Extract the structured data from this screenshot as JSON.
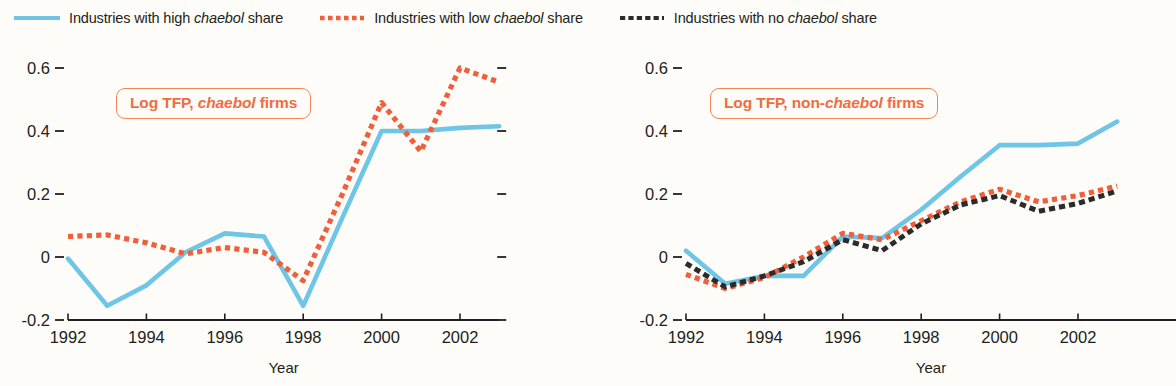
{
  "legend": {
    "items": [
      {
        "label_pre": "Industries with high ",
        "label_em": "chaebol",
        "label_post": " share",
        "style": "solid",
        "color": "#6ec5e6",
        "icon": "line-swatch-solid-blue"
      },
      {
        "label_pre": "Industries with low ",
        "label_em": "chaebol",
        "label_post": " share",
        "style": "dotted",
        "color": "#ef5f3c",
        "icon": "line-swatch-dotted-red"
      },
      {
        "label_pre": "Industries with no ",
        "label_em": "chaebol",
        "label_post": " share",
        "style": "dashed",
        "color": "#2b2b2b",
        "icon": "line-swatch-dashed-black"
      }
    ]
  },
  "panels": [
    {
      "id": "left",
      "annotation_pre": "Log TFP, ",
      "annotation_em": "chaebol",
      "annotation_post": " firms",
      "annotation_color": "#ef6d3f"
    },
    {
      "id": "right",
      "annotation_pre": "Log TFP, non-",
      "annotation_em": "chaebol",
      "annotation_post": " firms",
      "annotation_color": "#ef6d3f"
    }
  ],
  "axes": {
    "ylabel": "",
    "xlabel": "Year",
    "yticks": [
      "0.6",
      "0.4",
      "0.2",
      "0",
      "-0.2"
    ],
    "ytick_values": [
      0.6,
      0.4,
      0.2,
      0,
      -0.2
    ],
    "xticks": [
      "1992",
      "1994",
      "1996",
      "1998",
      "2000",
      "2002"
    ],
    "xtick_values": [
      1992,
      1994,
      1996,
      1998,
      2000,
      2002
    ],
    "ylim": [
      -0.2,
      0.6
    ],
    "xlim": [
      1992,
      2003
    ]
  },
  "chart_data": [
    {
      "type": "line",
      "title": "Log TFP, chaebol firms",
      "xlabel": "Year",
      "ylabel": "Log TFP",
      "xlim": [
        1992,
        2003
      ],
      "ylim": [
        -0.2,
        0.6
      ],
      "grid": false,
      "legend_position": "top",
      "x": [
        1992,
        1993,
        1994,
        1995,
        1996,
        1997,
        1998,
        1999,
        2000,
        2001,
        2002,
        2003
      ],
      "series": [
        {
          "name": "Industries with high chaebol share",
          "style": "solid",
          "color": "#6ec5e6",
          "values": [
            -0.005,
            -0.155,
            -0.09,
            0.015,
            0.075,
            0.065,
            -0.155,
            0.125,
            0.4,
            0.4,
            0.41,
            0.415
          ]
        },
        {
          "name": "Industries with low chaebol share",
          "style": "dotted",
          "color": "#ef5f3c",
          "values": [
            0.065,
            0.07,
            0.045,
            0.01,
            0.03,
            0.015,
            -0.075,
            0.2,
            0.49,
            0.335,
            0.6,
            0.555
          ]
        }
      ]
    },
    {
      "type": "line",
      "title": "Log TFP, non-chaebol firms",
      "xlabel": "Year",
      "ylabel": "Log TFP",
      "xlim": [
        1992,
        2003
      ],
      "ylim": [
        -0.2,
        0.6
      ],
      "grid": false,
      "legend_position": "top",
      "x": [
        1992,
        1993,
        1994,
        1995,
        1996,
        1997,
        1998,
        1999,
        2000,
        2001,
        2002,
        2003
      ],
      "series": [
        {
          "name": "Industries with high chaebol share",
          "style": "solid",
          "color": "#6ec5e6",
          "values": [
            0.02,
            -0.085,
            -0.06,
            -0.06,
            0.065,
            0.06,
            0.15,
            0.255,
            0.355,
            0.355,
            0.36,
            0.43
          ]
        },
        {
          "name": "Industries with low chaebol share",
          "style": "dotted",
          "color": "#ef5f3c",
          "values": [
            -0.055,
            -0.1,
            -0.065,
            0.0,
            0.075,
            0.055,
            0.115,
            0.175,
            0.215,
            0.175,
            0.195,
            0.225
          ]
        },
        {
          "name": "Industries with no chaebol share",
          "style": "dashed",
          "color": "#2b2b2b",
          "values": [
            -0.02,
            -0.095,
            -0.06,
            -0.015,
            0.055,
            0.02,
            0.105,
            0.165,
            0.195,
            0.145,
            0.17,
            0.21
          ]
        }
      ]
    }
  ]
}
